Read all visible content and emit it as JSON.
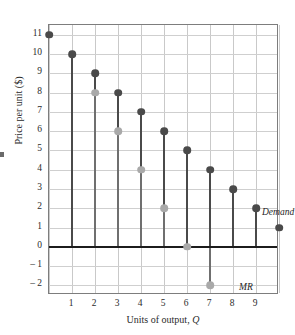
{
  "chart_data": {
    "type": "scatter",
    "title": "",
    "xlabel": "Units of output, Q",
    "ylabel": "Price per unit ($)",
    "xlim": [
      0,
      10
    ],
    "ylim": [
      -2.5,
      11.5
    ],
    "xticks": [
      1,
      2,
      3,
      4,
      5,
      6,
      7,
      8,
      9
    ],
    "yticks": [
      11,
      10,
      9,
      8,
      7,
      6,
      5,
      4,
      3,
      2,
      1,
      0,
      -1,
      -2
    ],
    "ytick_labels": [
      "11",
      "10",
      "9",
      "8",
      "7",
      "6",
      "5",
      "4",
      "3",
      "2",
      "1",
      "0",
      "– 1",
      "– 2"
    ],
    "grid": true,
    "legend_position": "inline-annotation",
    "x": [
      0,
      1,
      2,
      3,
      4,
      5,
      6,
      7,
      8,
      9,
      10
    ],
    "series": [
      {
        "name": "Demand",
        "color": "#4a4a4a",
        "x": [
          0,
          1,
          2,
          3,
          4,
          5,
          6,
          7,
          8,
          9,
          10
        ],
        "values": [
          11,
          10,
          9,
          8,
          7,
          6,
          5,
          4,
          3,
          2,
          1
        ]
      },
      {
        "name": "MR",
        "color": "#a9a9a9",
        "x": [
          2,
          3,
          4,
          5,
          6,
          7
        ],
        "values": [
          8,
          6,
          4,
          2,
          0,
          -2
        ]
      }
    ],
    "annotations": [
      {
        "text": "Demand",
        "x": 8,
        "y": 3
      },
      {
        "text": "MR",
        "x": 7,
        "y": -1.2
      }
    ],
    "zero_line": 0
  },
  "axes": {
    "y_title_main": "Price per unit ($)",
    "x_title_main": "Units of output, ",
    "x_title_var": "Q"
  }
}
